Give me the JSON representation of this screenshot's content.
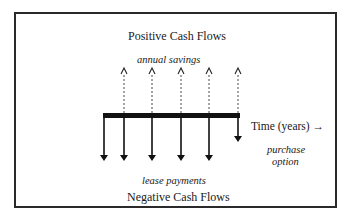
{
  "diagram": {
    "top_title": "Positive Cash Flows",
    "top_label": "annual savings",
    "bottom_label": "lease payments",
    "bottom_title": "Negative Cash Flows",
    "axis_label": "Time (years) →",
    "end_label_line1": "purchase",
    "end_label_line2": "option",
    "inflows": [
      {
        "period": 1,
        "type": "annual savings",
        "direction": "up"
      },
      {
        "period": 2,
        "type": "annual savings",
        "direction": "up"
      },
      {
        "period": 3,
        "type": "annual savings",
        "direction": "up"
      },
      {
        "period": 4,
        "type": "annual savings",
        "direction": "up"
      },
      {
        "period": 5,
        "type": "annual savings",
        "direction": "up"
      }
    ],
    "outflows": [
      {
        "period": 0,
        "type": "lease payment",
        "direction": "down"
      },
      {
        "period": 1,
        "type": "lease payment",
        "direction": "down"
      },
      {
        "period": 2,
        "type": "lease payment",
        "direction": "down"
      },
      {
        "period": 3,
        "type": "lease payment",
        "direction": "down"
      },
      {
        "period": 4,
        "type": "lease payment",
        "direction": "down"
      },
      {
        "period": 5,
        "type": "purchase option",
        "direction": "down"
      }
    ]
  }
}
